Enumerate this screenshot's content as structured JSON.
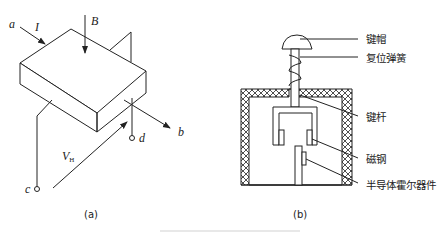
{
  "figure": {
    "panel_a": {
      "caption": "(a)",
      "labels": {
        "terminal_a": "a",
        "current": "I",
        "field": "B",
        "terminal_b": "b",
        "terminal_c": "c",
        "terminal_d": "d",
        "hall_voltage": "V",
        "hall_voltage_sub": "H"
      }
    },
    "panel_b": {
      "caption": "(b)",
      "callouts": [
        "键帽",
        "复位弹簧",
        "键杆",
        "磁钢",
        "半导体霍尔器件"
      ]
    }
  }
}
